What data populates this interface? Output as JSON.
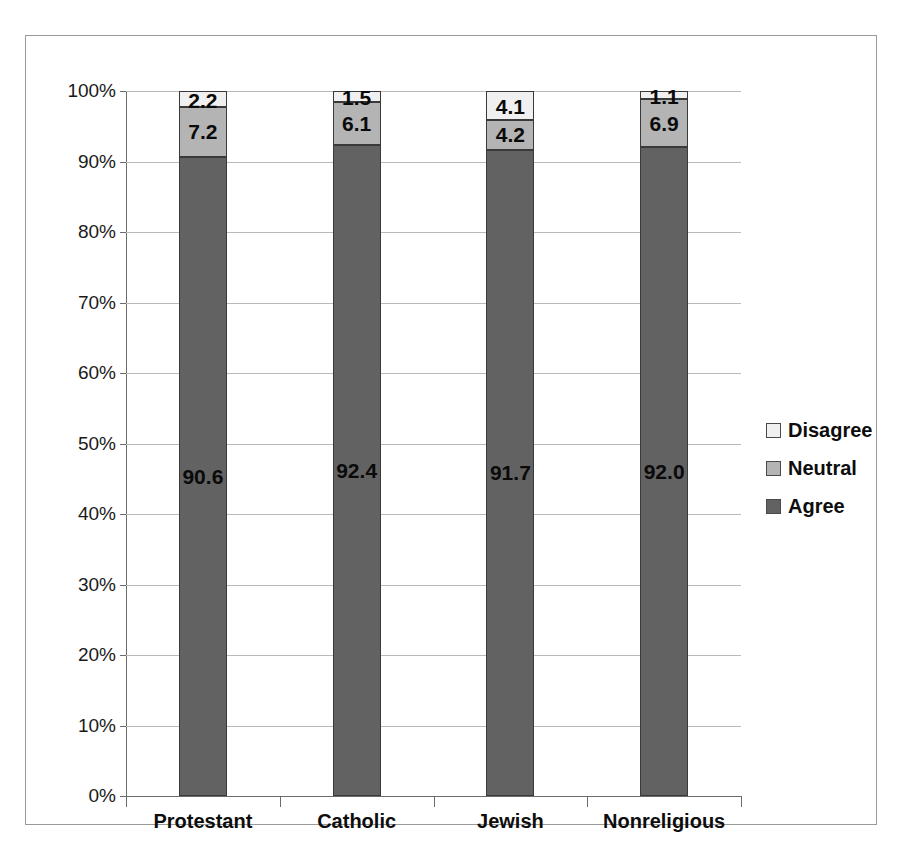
{
  "chart_data": {
    "type": "bar",
    "subtype": "stacked-100-percent",
    "title": "",
    "subtitle": "",
    "xlabel": "",
    "ylabel": "",
    "categories": [
      "Protestant",
      "Catholic",
      "Jewish",
      "Nonreligious"
    ],
    "series": [
      {
        "name": "Agree",
        "values": [
          90.6,
          92.4,
          91.7,
          92.0
        ],
        "color": "#626262"
      },
      {
        "name": "Neutral",
        "values": [
          7.2,
          6.1,
          4.2,
          6.9
        ],
        "color": "#b4b4b4"
      },
      {
        "name": "Disagree",
        "values": [
          2.2,
          1.5,
          4.1,
          1.1
        ],
        "color": "#f0f0f0"
      }
    ],
    "stack_order": [
      "Agree",
      "Neutral",
      "Disagree"
    ],
    "data_labels": {
      "Protestant": {
        "Agree": "90.6",
        "Neutral": "7.2",
        "Disagree": "2.2"
      },
      "Catholic": {
        "Agree": "92.4",
        "Neutral": "6.1",
        "Disagree": "1.5"
      },
      "Jewish": {
        "Agree": "91.7",
        "Neutral": "4.2",
        "Disagree": "4.1"
      },
      "Nonreligious": {
        "Agree": "92.0",
        "Neutral": "6.9",
        "Disagree": "1.1"
      }
    },
    "ylim": [
      0,
      100
    ],
    "ytick_values": [
      0,
      10,
      20,
      30,
      40,
      50,
      60,
      70,
      80,
      90,
      100
    ],
    "yticks": [
      "0%",
      "10%",
      "20%",
      "30%",
      "40%",
      "50%",
      "60%",
      "70%",
      "80%",
      "90%",
      "100%"
    ],
    "grid": true,
    "grid_axis": "y",
    "legend_position": "right",
    "legend": [
      "Disagree",
      "Neutral",
      "Agree"
    ]
  },
  "legend": {
    "items": [
      {
        "label": "Disagree",
        "color": "#f0f0f0"
      },
      {
        "label": "Neutral",
        "color": "#b4b4b4"
      },
      {
        "label": "Agree",
        "color": "#626262"
      }
    ]
  },
  "colors": {
    "agree": "#626262",
    "neutral": "#b4b4b4",
    "disagree": "#f0f0f0",
    "gridline": "#b9b9b9",
    "axis": "#6b6b6b",
    "frame": "#9a9a9a",
    "text": "#0d0d0d"
  }
}
